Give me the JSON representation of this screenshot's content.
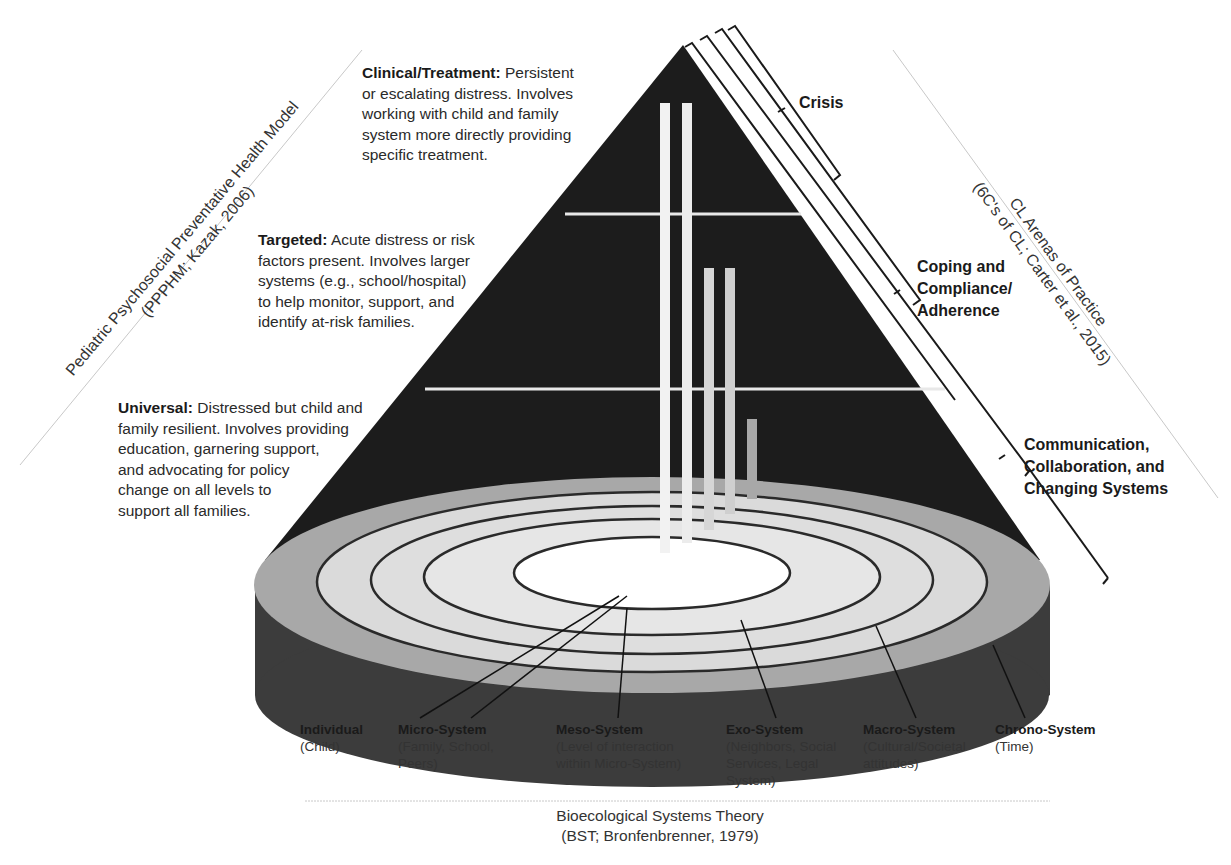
{
  "figure": {
    "pppm_axis": {
      "title": "Pediatric Psychosocial Preventative Health Model",
      "citation": "(PPPHM; Kazak, 2006)"
    },
    "tiers": [
      {
        "name": "Clinical/Treatment:",
        "description": "Persistent or escalating distress. Involves working with child and family system more directly providing specific treatment.",
        "lines": [
          "Persistent",
          "or escalating distress. Involves",
          "working with child and family",
          "system more directly providing",
          "specific treatment."
        ]
      },
      {
        "name": "Targeted:",
        "description": "Acute distress or risk factors present. Involves larger systems (e.g., school/hospital) to help monitor, support, and identify at-risk families.",
        "lines": [
          "Acute distress or risk",
          "factors present. Involves larger",
          "systems (e.g., school/hospital)",
          "to help monitor, support, and",
          "identify at-risk families."
        ]
      },
      {
        "name": "Universal:",
        "description": "Distressed but child and family resilient. Involves providing education, garnering support, and advocating for policy change on all levels to support all families.",
        "lines": [
          "Distressed but child and",
          "family resilient. Involves providing",
          "education, garnering support,",
          "and advocating for policy",
          "change on all levels to",
          "support all families."
        ]
      }
    ],
    "cl_axis": {
      "title": "CL Arenas of Practice",
      "citation": "(6C's of CL; Carter et al., 2015)"
    },
    "arenas": [
      {
        "lines": [
          "Crisis"
        ]
      },
      {
        "lines": [
          "Coping and",
          "Compliance/",
          "Adherence"
        ]
      },
      {
        "lines": [
          "Communication,",
          "Collaboration, and",
          "Changing Systems"
        ]
      }
    ],
    "systems": [
      {
        "title": "Individual",
        "lines": [
          "(Child)"
        ]
      },
      {
        "title": "Micro-System",
        "lines": [
          "(Family, School,",
          "Peers)"
        ]
      },
      {
        "title": "Meso-System",
        "lines": [
          "(Level of interaction",
          "within Micro-System)"
        ]
      },
      {
        "title": "Exo-System",
        "lines": [
          "(Neighbors, Social",
          "Services, Legal",
          "System)"
        ]
      },
      {
        "title": "Macro-System",
        "lines": [
          "(Cultural/Societal",
          "attitudes)"
        ]
      },
      {
        "title": "Chrono-System",
        "lines": [
          "(Time)"
        ]
      }
    ],
    "bst_axis": {
      "title": "Bioecological Systems Theory",
      "citation": "(BST; Bronfenbrenner, 1979)"
    },
    "colors": {
      "pyramid": "#1c1c1c",
      "base_side": "#3c3c3c",
      "outer_ring": "#a8a8a8",
      "inner_rings": "#dadada",
      "center": "#ffffff",
      "ring_lines": "#2a2a2a",
      "guide_lines": "#c8c8c8"
    }
  }
}
